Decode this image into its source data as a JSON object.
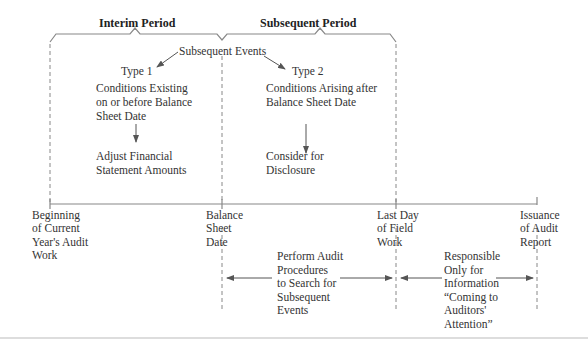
{
  "periods": {
    "interim": "Interim Period",
    "subsequent": "Subsequent Period"
  },
  "subsequent_events": {
    "title": "Subsequent Events",
    "type1": {
      "label": "Type 1",
      "condition": [
        "Conditions Existing",
        "on or before Balance",
        "Sheet Date"
      ],
      "action": [
        "Adjust Financial",
        "Statement Amounts"
      ]
    },
    "type2": {
      "label": "Type 2",
      "condition": [
        "Conditions Arising after",
        "Balance Sheet Date"
      ],
      "action": [
        "Consider for",
        "Disclosure"
      ]
    }
  },
  "timeline": {
    "points": [
      {
        "label": [
          "Beginning",
          "of Current",
          "Year's Audit",
          "Work"
        ]
      },
      {
        "label": [
          "Balance",
          "Sheet",
          "Date"
        ]
      },
      {
        "label": [
          "Last Day",
          "of Field",
          "Work"
        ]
      },
      {
        "label": [
          "Issuance",
          "of Audit",
          "Report"
        ]
      }
    ]
  },
  "responsibilities": {
    "field_work": [
      "Perform Audit",
      "Procedures",
      "to Search for",
      "Subsequent",
      "Events"
    ],
    "post_field_work": [
      "Responsible",
      "Only for",
      "Information",
      "“Coming to",
      "Auditors'",
      "Attention”"
    ]
  },
  "colors": {
    "line": "#777777",
    "text": "#333333"
  }
}
